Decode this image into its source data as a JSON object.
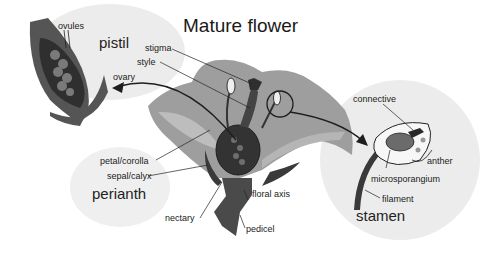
{
  "title": "Mature flower",
  "groups": {
    "pistil": "pistil",
    "perianth": "perianth",
    "stamen": "stamen"
  },
  "labels": {
    "ovules": "ovules",
    "ovary": "ovary",
    "stigma": "stigma",
    "style": "style",
    "petal_corolla": "petal/corolla",
    "sepal_calyx": "sepal/calyx",
    "nectary": "nectary",
    "floral_axis": "floral axis",
    "pedicel": "pedicel",
    "connective": "connective",
    "anther": "anther",
    "microsporangium": "microsporangium",
    "filament": "filament"
  },
  "colors": {
    "bubble": "#ececec",
    "petal": "#9e9e9e",
    "petal_light": "#bdbdbd",
    "dark_tissue": "#4a4a4a",
    "darkest": "#2a2a2a",
    "ovule": "#7a7a7a",
    "line": "#222222"
  }
}
